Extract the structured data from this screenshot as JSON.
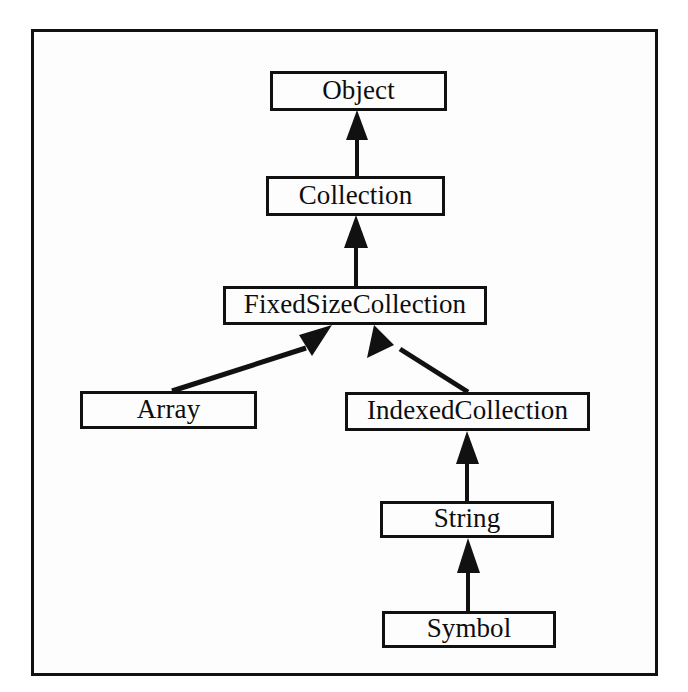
{
  "diagram": {
    "kind": "class-hierarchy-diagram",
    "notation": "uml-generalization",
    "frame": {
      "border_color": "#111111",
      "background": "#fdfdfd"
    },
    "nodes": [
      {
        "id": "object",
        "label": "Object"
      },
      {
        "id": "collection",
        "label": "Collection"
      },
      {
        "id": "fixedsize",
        "label": "FixedSizeCollection"
      },
      {
        "id": "array",
        "label": "Array"
      },
      {
        "id": "indexed",
        "label": "IndexedCollection"
      },
      {
        "id": "string",
        "label": "String"
      },
      {
        "id": "symbol",
        "label": "Symbol"
      }
    ],
    "edges": [
      {
        "from": "collection",
        "to": "object",
        "type": "inherits",
        "style": "vertical-arrow"
      },
      {
        "from": "fixedsize",
        "to": "collection",
        "type": "inherits",
        "style": "vertical-arrow"
      },
      {
        "from": "array",
        "to": "fixedsize",
        "type": "inherits",
        "style": "diagonal-arrow"
      },
      {
        "from": "indexed",
        "to": "fixedsize",
        "type": "inherits",
        "style": "diagonal-arrow"
      },
      {
        "from": "string",
        "to": "indexed",
        "type": "inherits",
        "style": "vertical-arrow"
      },
      {
        "from": "symbol",
        "to": "string",
        "type": "inherits",
        "style": "vertical-arrow"
      }
    ],
    "stroke_color": "#111111"
  }
}
